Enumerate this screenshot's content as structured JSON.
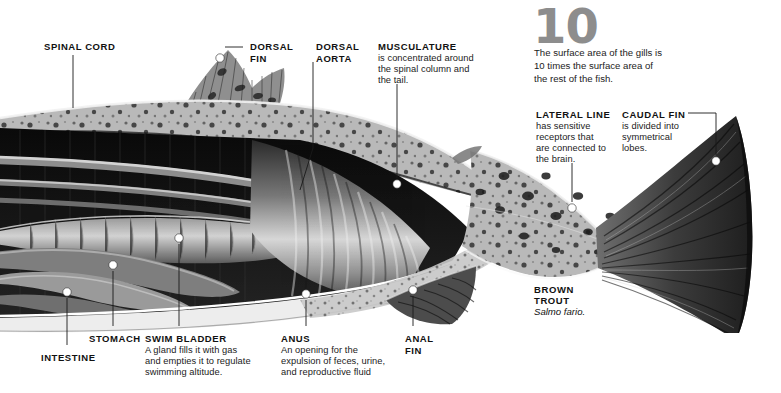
{
  "figure": {
    "background": "#ffffff",
    "label_color": "#111111",
    "leader_color": "#1a1a1a",
    "dot_color": "#ffffff",
    "bignum_color": "#8d8d8d"
  },
  "fact": {
    "number": "10",
    "text": "The surface area of the gills is\n10 times the surface area of\nthe rest of the fish."
  },
  "specimen": {
    "common_name": "BROWN\nTROUT",
    "scientific_name": "Salmo fario."
  },
  "labels": [
    {
      "id": "spinal-cord",
      "heading": "SPINAL CORD",
      "body": "",
      "heading_x": 44,
      "heading_y": 41,
      "leader": [
        [
          73,
          55
        ],
        [
          73,
          108
        ]
      ],
      "dot": null
    },
    {
      "id": "dorsal-fin",
      "heading": "DORSAL\nFIN",
      "body": "",
      "heading_x": 250,
      "heading_y": 41,
      "leader": [
        [
          243,
          47
        ],
        [
          225,
          47
        ]
      ],
      "dot": [
        220,
        58
      ]
    },
    {
      "id": "dorsal-aorta",
      "heading": "DORSAL\nAORTA",
      "body": "",
      "heading_x": 316,
      "heading_y": 41,
      "leader": [
        [
          313,
          62
        ],
        [
          313,
          148
        ],
        [
          300,
          190
        ]
      ],
      "dot": null
    },
    {
      "id": "musculature",
      "heading": "MUSCULATURE",
      "body": "is concentrated around\nthe spinal column and\nthe tail.",
      "heading_x": 378,
      "heading_y": 41,
      "leader": [
        [
          397,
          84
        ],
        [
          397,
          178
        ]
      ],
      "dot": [
        397,
        184
      ]
    },
    {
      "id": "lateral-line",
      "heading": "LATERAL LINE",
      "body": "has sensitive\nreceptors that\nare connected to\nthe brain.",
      "heading_x": 536,
      "heading_y": 109,
      "leader": [
        [
          572,
          163
        ],
        [
          572,
          202
        ]
      ],
      "dot": [
        572,
        208
      ]
    },
    {
      "id": "caudal-fin",
      "heading": "CAUDAL FIN",
      "body": "is divided into\nsymmetrical\nlobes.",
      "heading_x": 622,
      "heading_y": 109,
      "leader": [
        [
          688,
          113
        ],
        [
          716,
          113
        ],
        [
          716,
          155
        ]
      ],
      "dot": [
        716,
        161
      ]
    },
    {
      "id": "intestine",
      "heading": "INTESTINE",
      "body": "",
      "heading_x": 41,
      "heading_y": 352,
      "leader": [
        [
          67,
          298
        ],
        [
          67,
          345
        ]
      ],
      "dot": [
        67,
        292
      ]
    },
    {
      "id": "stomach",
      "heading": "STOMACH",
      "body": "",
      "heading_x": 89,
      "heading_y": 333,
      "leader": [
        [
          113,
          271
        ],
        [
          113,
          326
        ]
      ],
      "dot": [
        113,
        265
      ]
    },
    {
      "id": "swim-bladder",
      "heading": "SWIM BLADDER",
      "body": "A gland fills it with gas\nand empties it to regulate\nswimming altitude.",
      "heading_x": 145,
      "heading_y": 333,
      "leader": [
        [
          179,
          244
        ],
        [
          179,
          326
        ]
      ],
      "dot": [
        179,
        238
      ]
    },
    {
      "id": "anus",
      "heading": "ANUS",
      "body": "An opening for the\nexpulsion of feces, urine,\nand reproductive fluid",
      "heading_x": 281,
      "heading_y": 333,
      "leader": [
        [
          306,
          300
        ],
        [
          306,
          326
        ]
      ],
      "dot": [
        306,
        294
      ]
    },
    {
      "id": "anal-fin",
      "heading": "ANAL\nFIN",
      "body": "",
      "heading_x": 405,
      "heading_y": 333,
      "leader": [
        [
          413,
          296
        ],
        [
          413,
          326
        ]
      ],
      "dot": [
        413,
        290
      ]
    }
  ]
}
